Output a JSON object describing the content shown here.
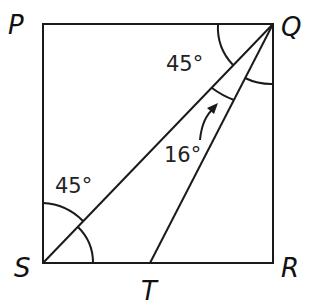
{
  "diagram": {
    "shape": "square PQRS with diagonal SQ and segment QT",
    "vertices": {
      "P": {
        "label": "P",
        "x": 43,
        "y": 24
      },
      "Q": {
        "label": "Q",
        "x": 273,
        "y": 24
      },
      "R": {
        "label": "R",
        "x": 273,
        "y": 263
      },
      "S": {
        "label": "S",
        "x": 43,
        "y": 263
      },
      "T": {
        "label": "T",
        "x": 150,
        "y": 263
      }
    },
    "angles": [
      {
        "name": "angle-PQS",
        "label": "45°"
      },
      {
        "name": "angle-PSQ",
        "label": "45°"
      },
      {
        "name": "angle-SQT",
        "label": "16°"
      }
    ],
    "stroke_color": "#1a1a1a"
  }
}
